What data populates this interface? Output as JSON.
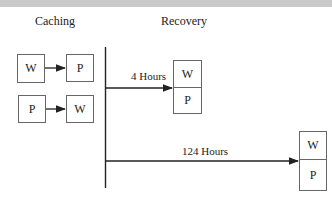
{
  "diagram": {
    "sections": {
      "caching": "Caching",
      "recovery": "Recovery"
    },
    "caching_rows": [
      {
        "from": "W",
        "to": "P"
      },
      {
        "from": "P",
        "to": "W"
      }
    ],
    "recovery_events": [
      {
        "label": "4 Hours",
        "stack": [
          "W",
          "P"
        ]
      },
      {
        "label": "124 Hours",
        "stack": [
          "W",
          "P"
        ]
      }
    ],
    "colors": {
      "line": "#222222",
      "box_border": "#666666",
      "top_bar": "#c9c9c9"
    }
  }
}
